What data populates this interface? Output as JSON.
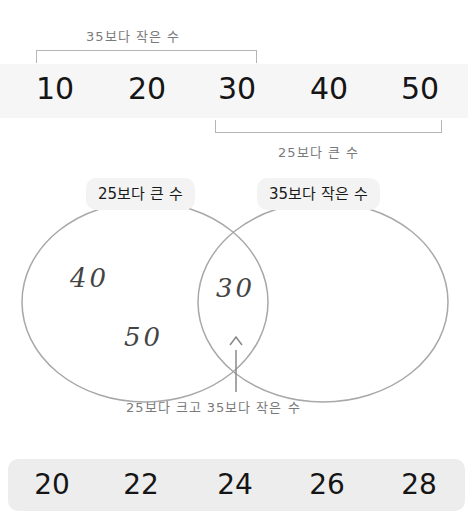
{
  "number_line": {
    "values": [
      "10",
      "20",
      "30",
      "40",
      "50"
    ],
    "top_bracket_label": "35보다 작은 수",
    "bottom_bracket_label": "25보다 큰 수"
  },
  "venn": {
    "left_set_label": "25보다 큰 수",
    "right_set_label": "35보다 작은 수",
    "left_only_values": [
      "40",
      "50"
    ],
    "intersection_values": [
      "30"
    ],
    "right_only_values": [],
    "intersection_annotation": "25보다 크고 35보다 작은 수"
  },
  "choices": {
    "values": [
      "20",
      "22",
      "24",
      "26",
      "28"
    ]
  },
  "colors": {
    "line": "#a8a8a8",
    "box_top": "#f6f6f6",
    "box_bottom": "#ededed",
    "pill": "#f3f3f3",
    "text": "#151515",
    "handwriting": "#7a7a7a"
  }
}
